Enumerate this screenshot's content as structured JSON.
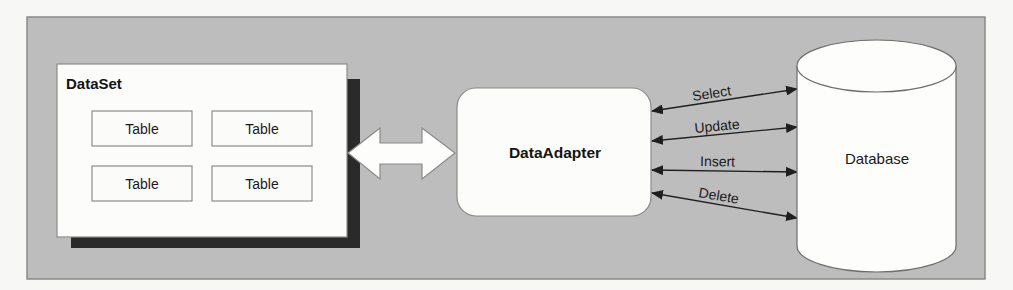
{
  "diagram": {
    "title": "",
    "colors": {
      "frame_bg": "#bdbdbd",
      "box_fill": "#fcfcfb",
      "shadow": "#2a2a2a",
      "line": "#1f1f1f"
    },
    "dataset": {
      "label": "DataSet",
      "tables": [
        {
          "label": "Table"
        },
        {
          "label": "Table"
        },
        {
          "label": "Table"
        },
        {
          "label": "Table"
        }
      ]
    },
    "adapter": {
      "label": "DataAdapter"
    },
    "database": {
      "label": "Database"
    },
    "connector": {
      "type": "bidirectional-block-arrow",
      "from": "DataSet",
      "to": "DataAdapter"
    },
    "commands": [
      {
        "label": "Select"
      },
      {
        "label": "Update"
      },
      {
        "label": "Insert"
      },
      {
        "label": "Delete"
      }
    ]
  }
}
